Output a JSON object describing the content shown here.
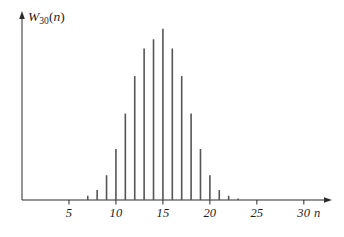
{
  "chart_data": {
    "type": "bar",
    "title": "",
    "subtitle": "",
    "ylabel": "W_30(n)",
    "ylabel_base": "W",
    "ylabel_subscript": "30",
    "ylabel_arg": "(n)",
    "xlabel": "n",
    "x": [
      0,
      1,
      2,
      3,
      4,
      5,
      6,
      7,
      8,
      9,
      10,
      11,
      12,
      13,
      14,
      15,
      16,
      17,
      18,
      19,
      20,
      21,
      22,
      23,
      24,
      25,
      26,
      27,
      28,
      29,
      30
    ],
    "values": [
      0,
      0,
      0,
      0,
      0,
      0,
      0,
      0.006,
      0.014,
      0.035,
      0.072,
      0.122,
      0.175,
      0.214,
      0.227,
      0.242,
      0.214,
      0.175,
      0.122,
      0.072,
      0.035,
      0.014,
      0.006,
      0.002,
      0,
      0,
      0,
      0,
      0,
      0,
      0
    ],
    "xtick_values": [
      5,
      10,
      15,
      20,
      25,
      30
    ],
    "xtick_labels": [
      "5",
      "10",
      "15",
      "20",
      "25",
      "30"
    ],
    "ytick_values": [],
    "ytick_labels": [],
    "xlim": [
      0,
      33
    ],
    "ylim": [
      0,
      0.25
    ],
    "grid": false,
    "legend": null,
    "annotations": [],
    "axis_arrows": true,
    "bar_color": "#555555",
    "axis_color": "#2b2b2b"
  },
  "axes": {
    "x_axis_name": "n",
    "y_axis_name": "W"
  }
}
